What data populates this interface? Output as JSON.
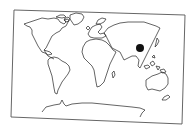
{
  "map": {
    "type": "world-outline",
    "style": "black line outline on white, tilted frame",
    "frame_color": "#555555",
    "land_outline_color": "#222222",
    "background_color": "#ffffff",
    "marker": {
      "shape": "filled-circle",
      "color": "#111111",
      "approx_region": "China / East Asia",
      "cx": 140,
      "cy": 48,
      "r": 4
    },
    "continents": [
      "North America",
      "Greenland",
      "South America",
      "Europe",
      "Africa",
      "Asia",
      "Australia",
      "Antarctica"
    ]
  }
}
